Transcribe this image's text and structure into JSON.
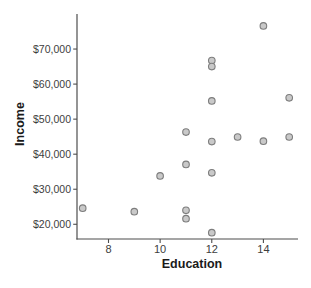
{
  "chart_data": {
    "type": "scatter",
    "title": "",
    "xlabel": "Education",
    "ylabel": "Income",
    "x_ticks": [
      8,
      10,
      12,
      14
    ],
    "x_tick_labels": [
      "8",
      "10",
      "12",
      "14"
    ],
    "y_ticks": [
      20000,
      30000,
      40000,
      50000,
      60000,
      70000
    ],
    "y_tick_labels": [
      "$20,000",
      "$30,000",
      "$40,000",
      "$50,000",
      "$60,000",
      "$70,000"
    ],
    "xlim": [
      6.78,
      15.34
    ],
    "ylim": [
      15800,
      80000
    ],
    "grid": "off",
    "legend": "none",
    "points": [
      {
        "x": 7,
        "y": 24600
      },
      {
        "x": 9,
        "y": 23600
      },
      {
        "x": 10,
        "y": 33800
      },
      {
        "x": 11,
        "y": 46300
      },
      {
        "x": 11,
        "y": 37100
      },
      {
        "x": 11,
        "y": 24000
      },
      {
        "x": 11,
        "y": 21600
      },
      {
        "x": 12,
        "y": 66700
      },
      {
        "x": 12,
        "y": 65000
      },
      {
        "x": 12,
        "y": 55200
      },
      {
        "x": 12,
        "y": 43600
      },
      {
        "x": 12,
        "y": 34700
      },
      {
        "x": 12,
        "y": 17600
      },
      {
        "x": 13,
        "y": 44900
      },
      {
        "x": 14,
        "y": 76600
      },
      {
        "x": 14,
        "y": 43700
      },
      {
        "x": 15,
        "y": 56100
      },
      {
        "x": 15,
        "y": 44900
      }
    ],
    "colors": {
      "marker_fill": "#c9c9c9",
      "marker_stroke": "#7d7d7d",
      "axis_line": "#4d4d4d",
      "tick_text": "#3d3d3d",
      "label_text": "#1a1a1a",
      "background": "#ffffff"
    }
  }
}
